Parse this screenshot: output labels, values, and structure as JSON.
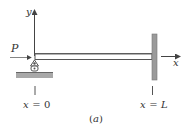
{
  "figure": {
    "caption": "(a)",
    "caption_letter": "a",
    "colors": {
      "line": "#444444",
      "wall": "#9a9a9a",
      "ground": "#a8a8a8",
      "beam_fill": "#ffffff",
      "text": "#333333"
    },
    "axes": {
      "y_label": "y",
      "x_label": "x"
    },
    "load": {
      "label": "P",
      "direction": "right"
    },
    "positions": {
      "left": {
        "var": "x",
        "eq": "=",
        "value": "0"
      },
      "right": {
        "var": "x",
        "eq": "=",
        "value": "L"
      }
    },
    "supports": {
      "left": "pin-roller",
      "right": "fixed-wall"
    }
  }
}
